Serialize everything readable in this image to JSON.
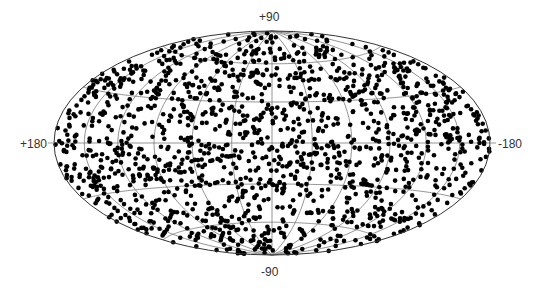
{
  "chart_data": {
    "type": "scatter",
    "projection": "Hammer-Aitoff (all-sky, equal-area)",
    "title": "",
    "xlabel": "",
    "ylabel": "",
    "labels": {
      "top": "+90",
      "bottom": "-90",
      "left": "+180",
      "right": "-180"
    },
    "longitude_range": [
      180,
      -180
    ],
    "latitude_range": [
      -90,
      90
    ],
    "graticule": {
      "meridians_deg": [
        -180,
        -150,
        -120,
        -90,
        -60,
        -30,
        0,
        30,
        60,
        90,
        120,
        150,
        180
      ],
      "parallels_deg": [
        -60,
        -30,
        0,
        30,
        60
      ],
      "color": "#777777"
    },
    "series": [
      {
        "name": "sources",
        "marker": "filled circle",
        "color": "#000000",
        "approx_count": 1500,
        "distribution": "approximately isotropic across the sky"
      }
    ],
    "legend": "none",
    "grid": true
  },
  "colors": {
    "background": "#ffffff",
    "outline": "#333333",
    "points": "#000000"
  }
}
